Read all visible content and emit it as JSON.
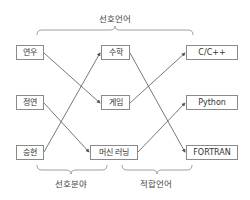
{
  "top_group": {
    "label": "선호언어"
  },
  "bottom_groups": [
    {
      "label": "선호분야"
    },
    {
      "label": "적합언어"
    }
  ],
  "columns": {
    "people": [
      {
        "id": "yeonwoo",
        "label": "연우"
      },
      {
        "id": "jeongyeon",
        "label": "정연"
      },
      {
        "id": "seunghyeon",
        "label": "승현"
      }
    ],
    "fields": [
      {
        "id": "math",
        "label": "수학"
      },
      {
        "id": "game",
        "label": "게임"
      },
      {
        "id": "ml",
        "label": "머신 러닝"
      }
    ],
    "languages": [
      {
        "id": "cpp",
        "label": "C/C++"
      },
      {
        "id": "python",
        "label": "Python"
      },
      {
        "id": "fortran",
        "label": "FORTRAN"
      }
    ]
  },
  "edges": [
    {
      "from": "연우",
      "to": "게임"
    },
    {
      "from": "정연",
      "to": "머신 러닝"
    },
    {
      "from": "승현",
      "to": "수학"
    },
    {
      "from": "수학",
      "to": "FORTRAN"
    },
    {
      "from": "게임",
      "to": "C/C++"
    },
    {
      "from": "머신 러닝",
      "to": "Python"
    }
  ],
  "colors": {
    "line": "#555555",
    "box_border": "#8a8a8a",
    "text": "#333333"
  }
}
